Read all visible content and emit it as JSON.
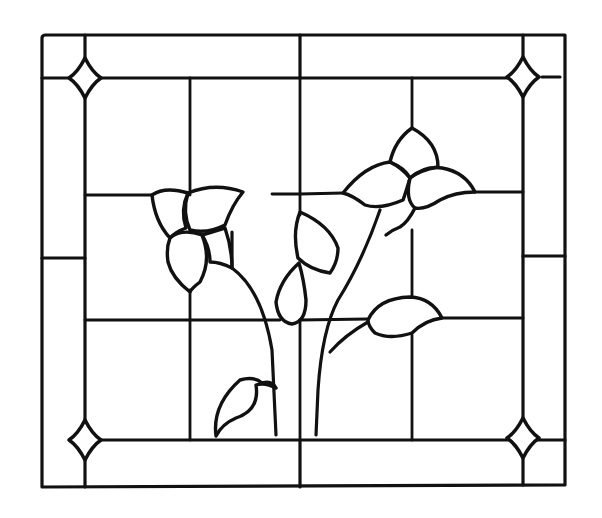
{
  "figure": {
    "line_color": "#111111",
    "background_color": "#ffffff"
  },
  "frame": {
    "outer": {
      "left": 42,
      "top": 35,
      "right": 565,
      "bottom": 485
    },
    "inner": {
      "left": 85,
      "top": 78,
      "right": 523,
      "bottom": 440
    },
    "border_midlines": {
      "top_x": 300,
      "bottom_x": 300,
      "left_y": 258,
      "right_y": 258
    },
    "corner_jewels": [
      "top-left",
      "top-right",
      "bottom-left",
      "bottom-right"
    ]
  },
  "grid": {
    "vertical_x": [
      190,
      300,
      412
    ],
    "horizontal_y": [
      195,
      320
    ]
  },
  "elements": [
    {
      "name": "left-flower",
      "type": "flower",
      "petals": 4
    },
    {
      "name": "right-flower",
      "type": "flower",
      "petals": 4
    },
    {
      "name": "center-leaf-upper",
      "type": "leaf"
    },
    {
      "name": "center-leaf-lower",
      "type": "leaf"
    },
    {
      "name": "right-leaf",
      "type": "leaf"
    },
    {
      "name": "bottom-bud",
      "type": "bud"
    },
    {
      "name": "stems",
      "type": "stem",
      "count": 2
    }
  ]
}
